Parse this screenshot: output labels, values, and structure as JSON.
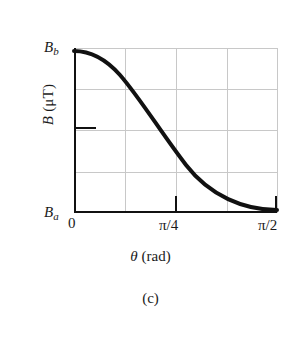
{
  "figure": {
    "caption": "(c)",
    "axes": {
      "x_title": {
        "symbol": "θ",
        "unit": "(rad)"
      },
      "y_title": "B (μT)"
    },
    "labels": {
      "y_max": {
        "var": "B",
        "sub": "b"
      },
      "y_min": {
        "var": "B",
        "sub": "a"
      }
    },
    "x_ticks": [
      "0",
      "π/4",
      "π/2"
    ]
  },
  "chart_data": {
    "type": "line",
    "title": "(c)",
    "xlabel": "θ (rad)",
    "ylabel": "B (μT)",
    "xlim": [
      0,
      1.5708
    ],
    "ylim": [
      0,
      1
    ],
    "xtick_values": [
      0,
      0.7854,
      1.5708
    ],
    "xtick_labels": [
      "0",
      "π/4",
      "π/2"
    ],
    "ytick_labels": [
      "B_a",
      "B_b"
    ],
    "ytick_values": [
      0,
      1
    ],
    "y_axis_min_label": "B_a",
    "y_axis_max_label": "B_b",
    "grid": true,
    "grid_x": [
      0.3927,
      0.7854,
      1.1781
    ],
    "grid_y": [
      0.25,
      0.5,
      0.75
    ],
    "legend": null,
    "series": [
      {
        "name": "B(θ)",
        "description": "cosine-squared decay from B_b at θ=0 to B_a at θ=π/2",
        "x": [
          0.0,
          0.0785,
          0.1571,
          0.2356,
          0.3142,
          0.3927,
          0.4712,
          0.5498,
          0.6283,
          0.7069,
          0.7854,
          0.8639,
          0.9425,
          1.021,
          1.0996,
          1.1781,
          1.2566,
          1.3352,
          1.4137,
          1.4923,
          1.5708
        ],
        "y": [
          1.0,
          0.9755,
          0.9045,
          0.7939,
          0.6545,
          0.5,
          0.3455,
          0.2061,
          0.0955,
          0.0245,
          0.0,
          0.0,
          0.0,
          0.0,
          0.0,
          0.0,
          0.0,
          0.0,
          0.0,
          0.0,
          0.0
        ]
      }
    ],
    "curve_points_px": "M0,3 C14,3 30,9 46,27 C66,50 88,86 112,117 C136,148 170,162 203,162",
    "line_color": "#111111",
    "line_width_px": 4,
    "grid_color": "#c8c8c8",
    "axis_color": "#111111"
  }
}
